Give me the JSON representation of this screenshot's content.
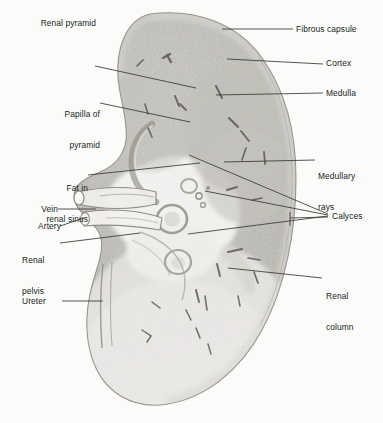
{
  "figure": {
    "width": 383,
    "height": 423,
    "background_color": "#fbfbfa",
    "ink_color": "#201d1c",
    "leader_line_color": "#3a3734",
    "tissue_tone_cortex": "#cfcdc8",
    "tissue_tone_medulla": "#c4c2bd",
    "tissue_tone_pale": "#ededea",
    "capsule_edge_color": "#9b9892"
  },
  "labels": [
    {
      "id": "fibrous-capsule",
      "text": "Fibrous capsule",
      "align": "left",
      "x": 296,
      "y": 18,
      "lines": [
        "Fibrous capsule"
      ]
    },
    {
      "id": "cortex",
      "text": "Cortex",
      "align": "left",
      "x": 326,
      "y": 60,
      "lines": [
        "Cortex"
      ]
    },
    {
      "id": "medulla",
      "text": "Medulla",
      "align": "left",
      "x": 326,
      "y": 89,
      "lines": [
        "Medulla"
      ]
    },
    {
      "id": "medullary-rays",
      "text": "Medullary rays",
      "align": "left",
      "x": 318,
      "y": 152,
      "lines": [
        "Medullary",
        "rays"
      ]
    },
    {
      "id": "calyces",
      "text": "Calyces",
      "align": "left",
      "x": 332,
      "y": 210,
      "lines": [
        "Calyces"
      ]
    },
    {
      "id": "renal-column",
      "text": "Renal column",
      "align": "left",
      "x": 326,
      "y": 272,
      "lines": [
        "Renal",
        "column"
      ]
    },
    {
      "id": "renal-pyramid",
      "text": "Renal pyramid",
      "align": "right",
      "x": 18,
      "y": 61,
      "lines": [
        "Renal pyramid"
      ]
    },
    {
      "id": "papilla-of-pyramid",
      "text": "Papilla of pyramid",
      "align": "right",
      "x": 20,
      "y": 92,
      "lines": [
        "Papilla of",
        "pyramid"
      ]
    },
    {
      "id": "fat-in-renal-sinus",
      "text": "Fat in renal sinus",
      "align": "right",
      "x": 22,
      "y": 166,
      "lines": [
        "Fat in",
        "renal sinus"
      ]
    },
    {
      "id": "vein",
      "text": "Vein",
      "align": "right",
      "x": 25,
      "y": 204,
      "lines": [
        "Vein"
      ]
    },
    {
      "id": "artery",
      "text": "Artery",
      "align": "right",
      "x": 25,
      "y": 222,
      "lines": [
        "Artery"
      ]
    },
    {
      "id": "renal-pelvis",
      "text": "Renal pelvis",
      "align": "left",
      "x": 22,
      "y": 236,
      "lines": [
        "Renal",
        "pelvis"
      ]
    },
    {
      "id": "ureter",
      "text": "Ureter",
      "align": "left",
      "x": 22,
      "y": 296,
      "lines": [
        "Ureter"
      ]
    }
  ],
  "leader_lines": [
    {
      "id": "leader-fibrous-capsule",
      "from": [
        293,
        29
      ],
      "to": [
        222,
        29
      ]
    },
    {
      "id": "leader-cortex",
      "from": [
        323,
        64
      ],
      "to": [
        227,
        59
      ]
    },
    {
      "id": "leader-medulla",
      "from": [
        323,
        93
      ],
      "to": [
        216,
        95
      ]
    },
    {
      "id": "leader-medullary-rays",
      "from": [
        315,
        160
      ],
      "to": [
        224,
        162
      ]
    },
    {
      "id": "leader-calyces-1",
      "from": [
        328,
        214
      ],
      "to": [
        189,
        155
      ]
    },
    {
      "id": "leader-calyces-2",
      "from": [
        328,
        215
      ],
      "to": [
        205,
        191
      ]
    },
    {
      "id": "leader-calyces-3",
      "from": [
        328,
        216
      ],
      "to": [
        188,
        234
      ]
    },
    {
      "id": "leader-calyces-4",
      "from": [
        328,
        217
      ],
      "to": [
        290,
        218
      ]
    },
    {
      "id": "leader-renal-column",
      "from": [
        322,
        278
      ],
      "to": [
        228,
        268
      ]
    },
    {
      "id": "leader-renal-pyramid",
      "from": [
        95,
        66
      ],
      "to": [
        196,
        88
      ]
    },
    {
      "id": "leader-papilla",
      "from": [
        100,
        103
      ],
      "to": [
        190,
        122
      ]
    },
    {
      "id": "leader-fat-sinus",
      "from": [
        88,
        175
      ],
      "to": [
        200,
        163
      ]
    },
    {
      "id": "leader-vein",
      "from": [
        58,
        209
      ],
      "to": [
        96,
        209
      ]
    },
    {
      "id": "leader-artery",
      "from": [
        60,
        226
      ],
      "to": [
        84,
        218
      ]
    },
    {
      "id": "leader-renal-pelvis",
      "from": [
        60,
        243
      ],
      "to": [
        140,
        233
      ]
    },
    {
      "id": "leader-ureter",
      "from": [
        62,
        301
      ],
      "to": [
        103,
        301
      ]
    }
  ],
  "anatomy_regions": [
    {
      "id": "renal-capsule-outline",
      "name": "Fibrous capsule (outer border)"
    },
    {
      "id": "cortex-zone",
      "name": "Cortex (outer mottled band)"
    },
    {
      "id": "medulla-zone",
      "name": "Medulla (inner gray pyramids)"
    },
    {
      "id": "renal-papilla-arc",
      "name": "Papilla of pyramid (curved arc)"
    },
    {
      "id": "renal-sinus-cavity",
      "name": "Renal sinus (pale central cavity)"
    },
    {
      "id": "calyx-ring-major",
      "name": "Major calyx ring"
    },
    {
      "id": "calyx-ring-minor",
      "name": "Minor calyx ring"
    },
    {
      "id": "renal-vein-tube",
      "name": "Renal vein (upper vessel)"
    },
    {
      "id": "renal-artery-tube",
      "name": "Renal artery (lower vessel)"
    },
    {
      "id": "renal-pelvis-funnel",
      "name": "Renal pelvis (funnel)"
    },
    {
      "id": "ureter-tube",
      "name": "Ureter (descending tube)"
    },
    {
      "id": "renal-column-band",
      "name": "Renal column (cortical extension)"
    },
    {
      "id": "medullary-ray-streaks",
      "name": "Medullary rays (dark striations)"
    }
  ]
}
